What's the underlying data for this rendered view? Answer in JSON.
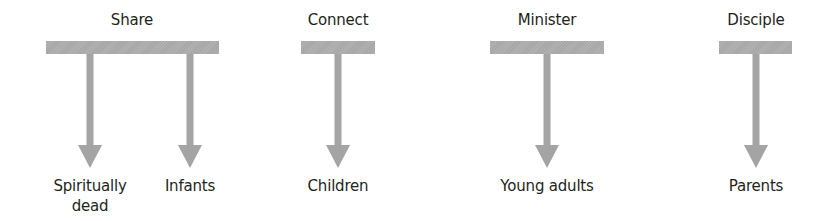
{
  "diagram": {
    "type": "branch-diagram",
    "colors": {
      "bar": "#ababab",
      "arrow": "#a4a4a4",
      "text": "#231f20",
      "background": "#ffffff"
    },
    "groups": [
      {
        "heading": "Share",
        "targets": [
          {
            "label_line1": "Spiritually",
            "label_line2": "dead"
          },
          {
            "label_line1": "Infants",
            "label_line2": ""
          }
        ]
      },
      {
        "heading": "Connect",
        "targets": [
          {
            "label_line1": "Children",
            "label_line2": ""
          }
        ]
      },
      {
        "heading": "Minister",
        "targets": [
          {
            "label_line1": "Young adults",
            "label_line2": ""
          }
        ]
      },
      {
        "heading": "Disciple",
        "targets": [
          {
            "label_line1": "Parents",
            "label_line2": ""
          }
        ]
      }
    ]
  }
}
